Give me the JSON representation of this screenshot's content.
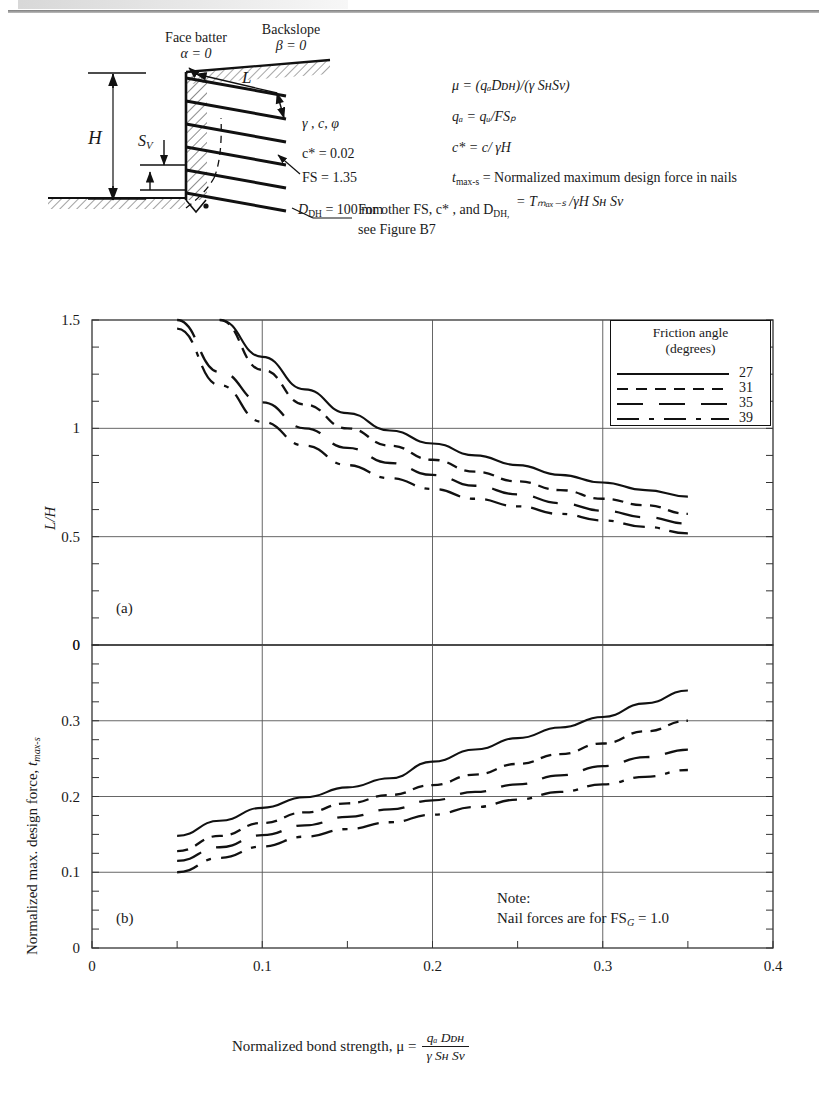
{
  "figure": {
    "panel_a_tag": "(a)",
    "panel_b_tag": "(b)",
    "note_line1": "Note:",
    "note_line2_pre": "Nail forces are for FS",
    "note_line2_sub": "G",
    "note_line2_post": "= 1.0"
  },
  "schematic": {
    "face_batter_label": "Face batter",
    "face_batter_value": "α = 0",
    "backslope_label": "Backslope",
    "backslope_value": "β = 0",
    "length_label": "L",
    "height_label": "H",
    "spacing_label": "S",
    "spacing_sub": "V",
    "soil_params": "γ , c, φ",
    "cstar_value_pre": "c* = 0.02",
    "fs_value": "FS = 1.35",
    "ddh_label_pre": "D",
    "ddh_label_sub": "DH",
    "ddh_label_post": "= 100 mm",
    "eq_mu": "μ = (qₐDᴅʜ)/(γ SʜSᴠ)",
    "eq_qa": "qₐ = qᵤ/FSₚ",
    "eq_cstar": "c* = c/ γH",
    "eq_tmax_line1": "= Normalized maximum design force in nails",
    "eq_tmax_line2": "= Tₘₐₓ₋ₛ /γH Sʜ Sᴠ",
    "eq_tmax_symbol": "t",
    "eq_tmax_symbol_sub": "max-s",
    "other_fs_line1": "For other FS, c* , and D",
    "other_fs_line1_sub": "DH,",
    "other_fs_line2": "see Figure B7"
  },
  "axes": {
    "y_a_label": "L/H",
    "y_a_ticks": [
      "1.5",
      "1",
      "0.5",
      "0"
    ],
    "y_a_values": [
      1.5,
      1.0,
      0.5,
      0.0
    ],
    "y_b_label_main": "Normalized max. design force, ",
    "y_b_label_sym": "t",
    "y_b_label_sub": "max-s",
    "y_b_ticks": [
      "0",
      "0.3",
      "0.2",
      "0.1",
      "0"
    ],
    "y_b_values": [
      0.4,
      0.3,
      0.2,
      0.1,
      0.0
    ],
    "x_ticks": [
      "0",
      "0.1",
      "0.2",
      "0.3",
      "0.4"
    ],
    "x_values": [
      0,
      0.1,
      0.2,
      0.3,
      0.4
    ],
    "x_title_main": "Normalized bond strength, μ =",
    "x_title_num": "qₐ Dᴅʜ",
    "x_title_den": "γ Sʜ Sᴠ"
  },
  "legend": {
    "title_line1": "Friction angle",
    "title_line2": "(degrees)",
    "entries": [
      {
        "value": "27",
        "style": "solid"
      },
      {
        "value": "31",
        "style": "dash"
      },
      {
        "value": "35",
        "style": "longdash"
      },
      {
        "value": "39",
        "style": "dashdot"
      }
    ]
  },
  "chart_data": [
    {
      "type": "line",
      "panel": "(a)",
      "title": "",
      "xlabel": "Normalized bond strength, mu = qa*DDH/(gamma*SH*SV)",
      "ylabel": "L/H",
      "xlim": [
        0,
        0.4
      ],
      "ylim": [
        0,
        1.5
      ],
      "grid": true,
      "legend_position": "top-right",
      "x": [
        0.05,
        0.075,
        0.1,
        0.125,
        0.15,
        0.175,
        0.2,
        0.225,
        0.25,
        0.275,
        0.3,
        0.325,
        0.35
      ],
      "series": [
        {
          "name": "27",
          "style": "solid",
          "values": [
            null,
            1.5,
            1.33,
            1.18,
            1.07,
            0.99,
            0.93,
            0.875,
            0.83,
            0.785,
            0.75,
            0.715,
            0.685
          ]
        },
        {
          "name": "31",
          "style": "dash",
          "values": [
            null,
            1.5,
            1.27,
            1.11,
            1.0,
            0.92,
            0.855,
            0.8,
            0.755,
            0.715,
            0.675,
            0.645,
            0.605
          ]
        },
        {
          "name": "35",
          "style": "longdash",
          "values": [
            1.5,
            1.26,
            1.12,
            1.0,
            0.91,
            0.84,
            0.785,
            0.735,
            0.695,
            0.655,
            0.62,
            0.59,
            0.56
          ]
        },
        {
          "name": "39",
          "style": "dashdot",
          "values": [
            1.46,
            1.2,
            1.03,
            0.92,
            0.83,
            0.77,
            0.72,
            0.675,
            0.64,
            0.605,
            0.575,
            0.545,
            0.515
          ]
        }
      ]
    },
    {
      "type": "line",
      "panel": "(b)",
      "title": "",
      "xlabel": "Normalized bond strength, mu = qa*DDH/(gamma*SH*SV)",
      "ylabel": "Normalized max. design force, t max-s",
      "xlim": [
        0,
        0.4
      ],
      "ylim": [
        0,
        0.4
      ],
      "grid": true,
      "note": "Nail forces are for FSG = 1.0",
      "x": [
        0.05,
        0.075,
        0.1,
        0.125,
        0.15,
        0.175,
        0.2,
        0.225,
        0.25,
        0.275,
        0.3,
        0.325,
        0.35
      ],
      "series": [
        {
          "name": "27",
          "style": "solid",
          "values": [
            0.148,
            0.168,
            0.185,
            0.199,
            0.212,
            0.224,
            0.246,
            0.262,
            0.277,
            0.291,
            0.305,
            0.323,
            0.34
          ]
        },
        {
          "name": "31",
          "style": "dash",
          "values": [
            0.128,
            0.148,
            0.165,
            0.179,
            0.191,
            0.202,
            0.215,
            0.229,
            0.243,
            0.256,
            0.27,
            0.286,
            0.3
          ]
        },
        {
          "name": "35",
          "style": "longdash",
          "values": [
            0.115,
            0.133,
            0.149,
            0.162,
            0.173,
            0.183,
            0.195,
            0.206,
            0.216,
            0.228,
            0.24,
            0.252,
            0.262
          ]
        },
        {
          "name": "39",
          "style": "dashdot",
          "values": [
            0.1,
            0.119,
            0.134,
            0.147,
            0.157,
            0.166,
            0.176,
            0.186,
            0.196,
            0.206,
            0.216,
            0.226,
            0.235
          ]
        }
      ]
    }
  ]
}
